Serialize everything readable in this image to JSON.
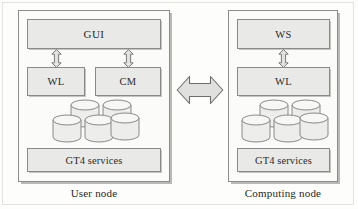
{
  "diagram": {
    "colors": {
      "box_fill": "#e9e9e7",
      "box_border": "#8a8a8a",
      "frame_border": "#8c8c8c",
      "frame_fill": "#fbfbf9",
      "arrow_fill": "#e0e0de",
      "arrow_border": "#6f6f6f",
      "cylinder_fill": "#ededeb",
      "cylinder_top": "#f6f6f4",
      "cylinder_border": "#7d7d7d",
      "text": "#1f1f1f",
      "page_background": "#fdfdfb"
    },
    "nodes": [
      {
        "id": "user-node",
        "caption": "User node",
        "components": [
          {
            "id": "gui",
            "label": "GUI"
          },
          {
            "id": "wl",
            "label": "WL"
          },
          {
            "id": "cm",
            "label": "CM"
          },
          {
            "id": "gt4",
            "label": "GT4 services"
          }
        ],
        "storage": {
          "name": "database-cylinder-cluster",
          "count": 5,
          "back_row": 2,
          "front_row": 3
        },
        "connectors": [
          {
            "id": "gui-wl",
            "from": "GUI",
            "to": "WL",
            "style": "vertical-double-arrow"
          },
          {
            "id": "gui-cm",
            "from": "GUI",
            "to": "CM",
            "style": "vertical-double-arrow"
          }
        ]
      },
      {
        "id": "computing-node",
        "caption": "Computing node",
        "components": [
          {
            "id": "ws",
            "label": "WS"
          },
          {
            "id": "wl",
            "label": "WL"
          },
          {
            "id": "gt4",
            "label": "GT4 services"
          }
        ],
        "storage": {
          "name": "database-cylinder-cluster",
          "count": 5,
          "back_row": 2,
          "front_row": 3
        },
        "connectors": [
          {
            "id": "ws-wl",
            "from": "WS",
            "to": "WL",
            "style": "vertical-double-arrow"
          }
        ]
      }
    ],
    "link": {
      "id": "node-link",
      "style": "horizontal-double-arrow",
      "from": "User node",
      "to": "Computing node"
    }
  }
}
